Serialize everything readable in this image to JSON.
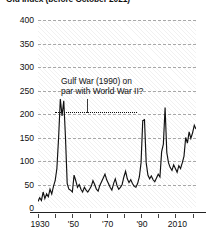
{
  "chart_data": {
    "type": "line",
    "title": "Old Index (before October 2021)",
    "xlabel": "",
    "ylabel": "",
    "xlim": [
      1929,
      2021
    ],
    "ylim": [
      0,
      400
    ],
    "ytick_values": [
      0,
      50,
      100,
      150,
      200,
      250,
      300,
      350,
      400
    ],
    "ytick_labels": [
      "0",
      "50",
      "100",
      "150",
      "200",
      "250",
      "300",
      "350",
      "400"
    ],
    "xtick_values": [
      1930,
      1940,
      1950,
      1960,
      1970,
      1980,
      1990,
      2000,
      2010,
      2020
    ],
    "xtick_labels": [
      "1930",
      "",
      "'50",
      "",
      "'70",
      "",
      "'90",
      "",
      "2010",
      ""
    ],
    "grid": "horizontal-dashed",
    "legend": "none",
    "series": [
      {
        "name": "Old Index (before October 2021)",
        "color": "#111111",
        "x": [
          1929,
          1930,
          1931,
          1932,
          1933,
          1934,
          1935,
          1936,
          1937,
          1938,
          1939,
          1940,
          1941,
          1942,
          1943,
          1944,
          1945,
          1946,
          1947,
          1948,
          1949,
          1950,
          1951,
          1952,
          1953,
          1954,
          1955,
          1956,
          1957,
          1958,
          1959,
          1960,
          1961,
          1962,
          1963,
          1964,
          1965,
          1966,
          1967,
          1968,
          1969,
          1970,
          1971,
          1972,
          1973,
          1974,
          1975,
          1976,
          1977,
          1978,
          1979,
          1980,
          1981,
          1982,
          1983,
          1984,
          1985,
          1986,
          1987,
          1988,
          1989,
          1990,
          1991,
          1992,
          1993,
          1994,
          1995,
          1996,
          1997,
          1998,
          1999,
          2000,
          2001,
          2002,
          2003,
          2004,
          2005,
          2006,
          2007,
          2008,
          2009,
          2010,
          2011,
          2012,
          2013,
          2014,
          2015,
          2016,
          2017,
          2018,
          2019,
          2020,
          2021
        ],
        "values": [
          14,
          22,
          16,
          34,
          20,
          30,
          24,
          40,
          30,
          46,
          58,
          84,
          150,
          232,
          196,
          228,
          150,
          52,
          40,
          38,
          34,
          70,
          58,
          44,
          50,
          40,
          34,
          44,
          38,
          34,
          40,
          46,
          58,
          50,
          40,
          36,
          48,
          56,
          64,
          72,
          60,
          52,
          44,
          38,
          52,
          62,
          48,
          40,
          44,
          50,
          66,
          78,
          62,
          54,
          60,
          52,
          46,
          44,
          52,
          66,
          96,
          186,
          188,
          96,
          70,
          62,
          68,
          60,
          56,
          64,
          72,
          66,
          120,
          136,
          214,
          118,
          96,
          86,
          80,
          92,
          84,
          76,
          90,
          84,
          96,
          110,
          150,
          138,
          162,
          148,
          160,
          176,
          168
        ],
        "peaks": [
          {
            "label": "World War II",
            "year": 1942,
            "value": 232
          },
          {
            "label": "Gulf War",
            "year": 1990,
            "value": 186
          },
          {
            "label": "Iraq War",
            "year": 2003,
            "value": 214
          }
        ]
      }
    ],
    "annotations": [
      {
        "name": "gulf-war-annotation",
        "line1": "Gulf War (1990) on",
        "line2": "par with World War II?",
        "comparison_level": 185,
        "comparison_span_years": [
          1942,
          1990
        ]
      }
    ]
  }
}
